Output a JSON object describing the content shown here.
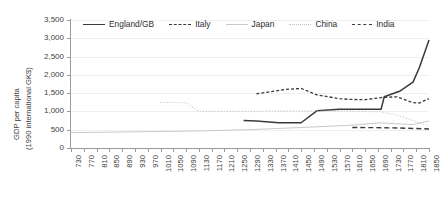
{
  "axes": {
    "ylabel_line1": "GDP per capita",
    "ylabel_line2": "(1990 international GK$)",
    "y_ticks": [
      "3,500",
      "3,000",
      "2,500",
      "2,000",
      "1,500",
      "1,000",
      "500",
      "0"
    ],
    "x_ticks": [
      "730",
      "770",
      "810",
      "850",
      "890",
      "930",
      "970",
      "1010",
      "1050",
      "1090",
      "1130",
      "1170",
      "1210",
      "1250",
      "1290",
      "1330",
      "1370",
      "1410",
      "1450",
      "1490",
      "1530",
      "1570",
      "1610",
      "1650",
      "1690",
      "1730",
      "1770",
      "1810",
      "1850"
    ]
  },
  "legend": {
    "items": [
      {
        "label": "England/GB",
        "style": "sw-solid-dark",
        "color": "#3a3a3a"
      },
      {
        "label": "Italy",
        "style": "sw-dash-dark",
        "color": "#3a3a3a"
      },
      {
        "label": "Japan",
        "style": "sw-solid-light",
        "color": "#c9c9c9"
      },
      {
        "label": "China",
        "style": "sw-dot-light",
        "color": "#c4c4c4"
      },
      {
        "label": "India",
        "style": "sw-dash-long",
        "color": "#3a3a3a"
      }
    ]
  },
  "chart_data": {
    "type": "line",
    "title": "",
    "xlabel": "",
    "ylabel": "GDP per capita (1990 international GK$)",
    "xlim": [
      730,
      1850
    ],
    "ylim": [
      0,
      3500
    ],
    "ytick_interval": 500,
    "xtick_interval": 40,
    "grid": "horizontal",
    "legend_position": "top",
    "series": [
      {
        "name": "England/GB",
        "color": "#3a3a3a",
        "dash": "none",
        "width": 1.5,
        "x": [
          1270,
          1310,
          1380,
          1450,
          1500,
          1570,
          1650,
          1700,
          1710,
          1760,
          1800,
          1820,
          1850
        ],
        "y": [
          750,
          740,
          690,
          690,
          1020,
          1060,
          1060,
          1060,
          1400,
          1560,
          1800,
          2200,
          2950
        ]
      },
      {
        "name": "Italy",
        "color": "#3a3a3a",
        "dash": "3,2",
        "width": 1.3,
        "x": [
          1310,
          1400,
          1450,
          1500,
          1570,
          1600,
          1650,
          1700,
          1750,
          1800,
          1820,
          1850
        ],
        "y": [
          1480,
          1600,
          1630,
          1450,
          1350,
          1330,
          1320,
          1380,
          1400,
          1240,
          1230,
          1350
        ]
      },
      {
        "name": "Japan",
        "color": "#c9c9c9",
        "dash": "none",
        "width": 1.0,
        "x": [
          730,
          1000,
          1150,
          1280,
          1450,
          1600,
          1700,
          1750,
          1800,
          1850
        ],
        "y": [
          420,
          450,
          470,
          500,
          560,
          620,
          690,
          660,
          640,
          740
        ]
      },
      {
        "name": "China",
        "color": "#c4c4c4",
        "dash": "1,2",
        "width": 1.2,
        "x": [
          1010,
          1090,
          1130,
          1250,
          1400,
          1500,
          1600,
          1700,
          1750,
          1800,
          1850
        ],
        "y": [
          1250,
          1240,
          1000,
          1000,
          1010,
          1010,
          1010,
          990,
          900,
          750,
          600
        ]
      },
      {
        "name": "India",
        "color": "#3a3a3a",
        "dash": "5,3",
        "width": 1.4,
        "x": [
          1610,
          1700,
          1760,
          1800,
          1850
        ],
        "y": [
          560,
          555,
          545,
          535,
          520
        ]
      }
    ]
  }
}
